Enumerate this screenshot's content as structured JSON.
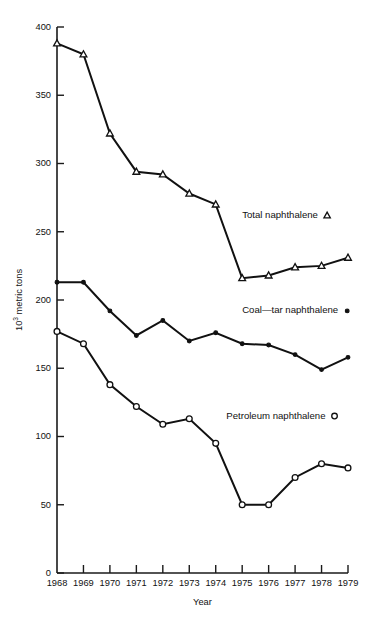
{
  "chart_data": {
    "type": "line",
    "title": "",
    "xlabel": "Year",
    "ylabel": "10³ metric tons",
    "ylabel_base": "10",
    "ylabel_exp": "3",
    "ylabel_tail": " metric tons",
    "categories": [
      1968,
      1969,
      1970,
      1971,
      1972,
      1973,
      1974,
      1975,
      1976,
      1977,
      1978,
      1979
    ],
    "x_tick_labels": [
      "1968",
      "1969",
      "1970",
      "1971",
      "1972",
      "1973",
      "1974",
      "1975",
      "1976",
      "1977",
      "1978",
      "1979"
    ],
    "y_tick_labels": [
      "0",
      "50",
      "100",
      "150",
      "200",
      "250",
      "300",
      "350",
      "400"
    ],
    "y_ticks": [
      0,
      50,
      100,
      150,
      200,
      250,
      300,
      350,
      400
    ],
    "ylim": [
      0,
      400
    ],
    "xlim": [
      1968,
      1979
    ],
    "grid": false,
    "legend_position": "inside-right",
    "series": [
      {
        "name": "Total naphthalene",
        "marker": "triangle-open",
        "marker_glyph": "△",
        "label": "Total naphthalene",
        "color": "#111111",
        "values": [
          388,
          380,
          322,
          294,
          292,
          278,
          270,
          216,
          218,
          224,
          225,
          231
        ]
      },
      {
        "name": "Coal—tar naphthalene",
        "marker": "dot-filled",
        "marker_glyph": "•",
        "label": "Coal—tar naphthalene",
        "color": "#111111",
        "values": [
          213,
          213,
          192,
          174,
          185,
          170,
          176,
          168,
          167,
          160,
          149,
          158
        ]
      },
      {
        "name": "Petroleum naphthalene",
        "marker": "circle-open",
        "marker_glyph": "○",
        "label": "Petroleum naphthalene",
        "color": "#111111",
        "values": [
          177,
          168,
          138,
          122,
          109,
          113,
          95,
          50,
          50,
          70,
          80,
          77
        ]
      }
    ],
    "annotations": [
      {
        "text": "Total naphthalene",
        "glyph": "△",
        "x": 1975.0,
        "y": 262
      },
      {
        "text": "Coal—tar naphthalene",
        "glyph": "•",
        "x": 1975.0,
        "y": 192
      },
      {
        "text": "Petroleum naphthalene",
        "glyph": "○",
        "x": 1974.4,
        "y": 115
      }
    ]
  }
}
